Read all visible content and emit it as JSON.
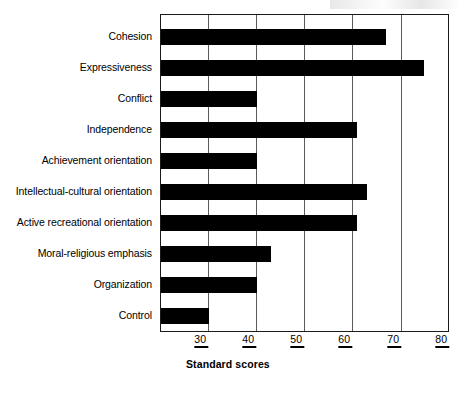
{
  "chart_data": {
    "type": "bar",
    "orientation": "horizontal",
    "title": "",
    "xlabel": "Standard scores",
    "ylabel": "",
    "xlim": [
      20,
      80
    ],
    "xticks": [
      30,
      40,
      50,
      60,
      70,
      80
    ],
    "xtick_labels": [
      "30",
      "40",
      "50",
      "60",
      "70",
      "80"
    ],
    "grid": true,
    "grid_axis": "x",
    "legend": false,
    "bar_color": "#000000",
    "categories": [
      "Cohesion",
      "Expressiveness",
      "Conflict",
      "Independence",
      "Achievement orientation",
      "Intellectual-cultural orientation",
      "Active recreational orientation",
      "Moral-religious emphasis",
      "Organization",
      "Control"
    ],
    "values": [
      67,
      75,
      40,
      61,
      40,
      63,
      61,
      43,
      40,
      30
    ]
  },
  "axis": {
    "x_title": "Standard scores"
  }
}
